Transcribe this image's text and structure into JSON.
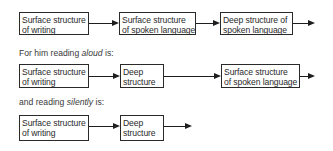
{
  "diagram": {
    "row1": {
      "boxes": [
        {
          "line1": "Surface structure",
          "line2": "of writing"
        },
        {
          "line1": "Surface structure",
          "line2": "of spoken language"
        },
        {
          "line1": "Deep structure of",
          "line2": "spoken language"
        }
      ]
    },
    "caption_aloud": {
      "prefix": "For him reading ",
      "emphasis": "aloud",
      "suffix": " is:"
    },
    "row2": {
      "boxes": [
        {
          "line1": "Surface structure",
          "line2": "of writing"
        },
        {
          "line1": "Deep",
          "line2": "structure"
        },
        {
          "line1": "Surface structure",
          "line2": "of spoken language"
        }
      ]
    },
    "caption_silently": {
      "prefix": "and reading ",
      "emphasis": "silently",
      "suffix": " is:"
    },
    "row3": {
      "boxes": [
        {
          "line1": "Surface structure",
          "line2": "of writing"
        },
        {
          "line1": "Deep",
          "line2": "structure"
        }
      ]
    }
  }
}
